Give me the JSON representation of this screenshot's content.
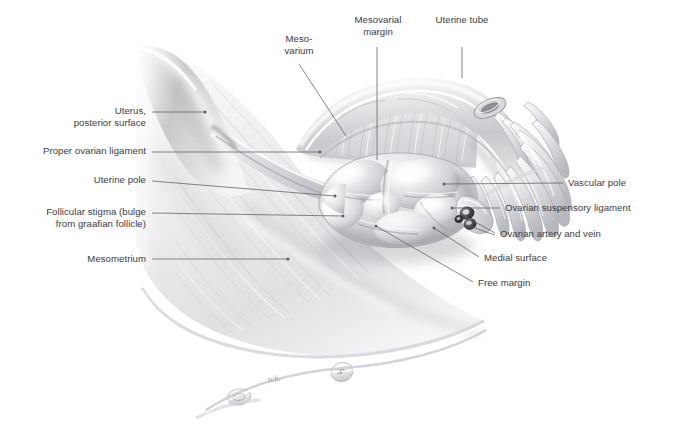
{
  "figure": {
    "background": "#ffffff",
    "width": 685,
    "height": 443,
    "label_color": "#3b3b3f",
    "leader_color": "#5d5d63",
    "signature": "sch."
  },
  "labels": {
    "mesovarium": {
      "text": "Meso-\nvarium",
      "x": 268,
      "y": 33,
      "w": 62,
      "align": "center"
    },
    "mesovarial_margin": {
      "text": "Mesovarial\nmargin",
      "x": 336,
      "y": 14,
      "w": 84,
      "align": "center"
    },
    "uterine_tube": {
      "text": "Uterine tube",
      "x": 421,
      "y": 14,
      "w": 82,
      "align": "center"
    },
    "uterus": {
      "text": "Uterus,\nposterior surface",
      "x": 27,
      "y": 105,
      "w": 119,
      "align": "right"
    },
    "proper_ovarian": {
      "text": "Proper ovarian ligament",
      "x": 11,
      "y": 145,
      "w": 135,
      "align": "right"
    },
    "uterine_pole": {
      "text": "Uterine pole",
      "x": 60,
      "y": 174,
      "w": 86,
      "align": "right"
    },
    "follicular_stigma": {
      "text": "Follicular stigma (bulge\nfrom graafian follicle)",
      "x": 14,
      "y": 206,
      "w": 132,
      "align": "right"
    },
    "mesometrium": {
      "text": "Mesometrium",
      "x": 56,
      "y": 253,
      "w": 90,
      "align": "right"
    },
    "vascular_pole": {
      "text": "Vascular pole",
      "x": 568,
      "y": 177,
      "w": 100,
      "align": "left"
    },
    "suspensory_lig": {
      "text": "Ovarian suspensory ligament",
      "x": 505,
      "y": 202,
      "w": 165,
      "align": "left"
    },
    "artery_vein": {
      "text": "Ovarian artery and vein",
      "x": 500,
      "y": 228,
      "w": 140,
      "align": "left"
    },
    "medial_surface": {
      "text": "Medial surface",
      "x": 484,
      "y": 252,
      "w": 104,
      "align": "left"
    },
    "free_margin": {
      "text": "Free margin",
      "x": 478,
      "y": 277,
      "w": 90,
      "align": "left"
    }
  },
  "leaders": [
    {
      "name": "leader-mesovarium",
      "points": "299,64 346,136"
    },
    {
      "name": "leader-mesovarial-margin",
      "points": "377,47 377,160"
    },
    {
      "name": "leader-uterine-tube",
      "points": "462,47 462,78"
    },
    {
      "name": "leader-uterus",
      "points": "152,112 205,112",
      "dot": "205,112"
    },
    {
      "name": "leader-proper-ovarian",
      "points": "152,152 320,152",
      "dot": "320,152"
    },
    {
      "name": "leader-uterine-pole",
      "points": "152,181 335,196",
      "dot": "335,196"
    },
    {
      "name": "leader-follicular-stigma",
      "points": "152,213 343,216",
      "dot": "343,216"
    },
    {
      "name": "leader-mesometrium",
      "points": "152,259 288,259",
      "dot": "288,259"
    },
    {
      "name": "leader-vascular-pole",
      "points": "563,183 444,184",
      "dot": "444,184"
    },
    {
      "name": "leader-suspensory-lig",
      "points": "500,208 452,208",
      "dot": "452,208"
    },
    {
      "name": "leader-artery-vein-1",
      "points": "495,233 466,217",
      "dot": "466,217"
    },
    {
      "name": "leader-artery-vein-2",
      "points": "495,235 469,226",
      "dot": "469,226"
    },
    {
      "name": "leader-medial-surface",
      "points": "479,257 434,228",
      "dot": "434,228"
    },
    {
      "name": "leader-free-margin",
      "points": "473,282 376,226",
      "dot": "376,226"
    }
  ],
  "structures": [
    {
      "name": "uterus-body",
      "label": "Uterus, posterior surface"
    },
    {
      "name": "mesometrium-sheet",
      "label": "Mesometrium"
    },
    {
      "name": "mesovarium-membrane",
      "label": "Mesovarium"
    },
    {
      "name": "ovary-body",
      "label": "Ovary"
    },
    {
      "name": "proper-ovarian-ligament",
      "label": "Proper ovarian ligament"
    },
    {
      "name": "uterine-tube-ampulla",
      "label": "Uterine tube"
    },
    {
      "name": "fimbriae",
      "label": "Fimbriae of uterine tube"
    },
    {
      "name": "ovarian-vessels",
      "label": "Ovarian artery and vein"
    },
    {
      "name": "suspensory-ligament",
      "label": "Ovarian suspensory ligament"
    },
    {
      "name": "follicular-bulges",
      "label": "Graafian follicles"
    }
  ]
}
